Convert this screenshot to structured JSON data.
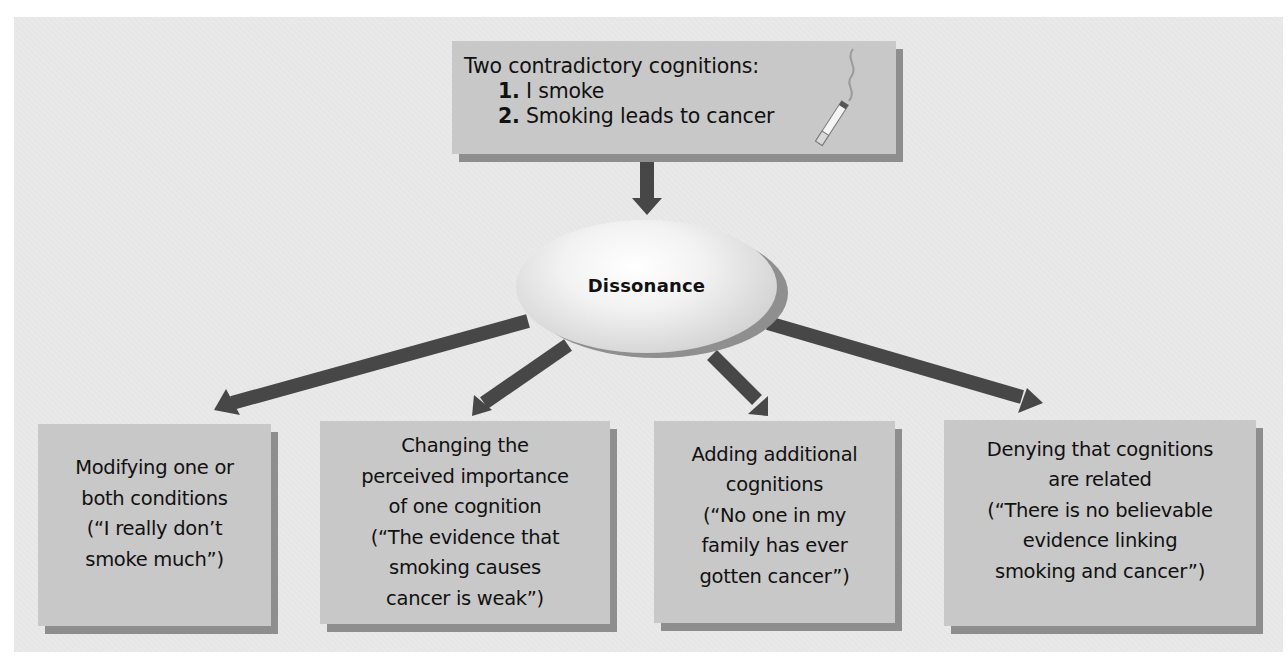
{
  "diagram": {
    "type": "flow",
    "top_box": {
      "heading": "Two contradictory cognitions:",
      "items": [
        {
          "number": "1.",
          "text": "I smoke"
        },
        {
          "number": "2.",
          "text": "Smoking leads to cancer"
        }
      ],
      "icon": "cigarette-icon"
    },
    "center_node": {
      "label": "Dissonance"
    },
    "outcomes": [
      {
        "label": "Modifying one or\nboth conditions\n(“I really don’t\nsmoke much”)"
      },
      {
        "label": "Changing the\nperceived importance\nof one cognition\n(“The evidence that\nsmoking causes\ncancer is weak”)"
      },
      {
        "label": "Adding additional\ncognitions\n(“No one in my\nfamily has ever\ngotten cancer”)"
      },
      {
        "label": "Denying that cognitions\nare related\n(“There is no believable\nevidence linking\nsmoking and cancer”)"
      }
    ],
    "colors": {
      "background": "#e9e9e9",
      "box_fill": "#c8c8c8",
      "box_shadow": "#8e8e8e",
      "arrow": "#474747"
    }
  }
}
